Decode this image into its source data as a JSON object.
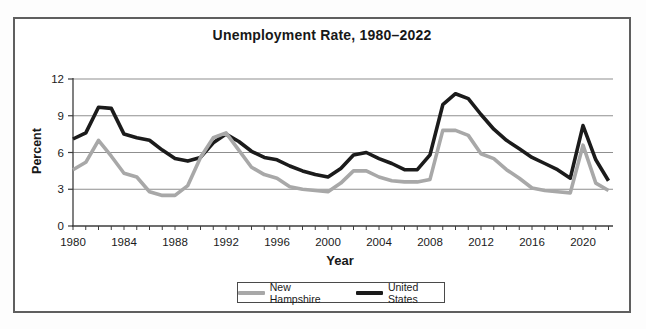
{
  "figure": {
    "title": "Unemployment Rate, 1980–2022",
    "xlabel": "Year",
    "ylabel": "Percent"
  },
  "chart_data": {
    "type": "line",
    "title": "Unemployment Rate, 1980–2022",
    "xlabel": "Year",
    "ylabel": "Percent",
    "x": [
      1980,
      1981,
      1982,
      1983,
      1984,
      1985,
      1986,
      1987,
      1988,
      1989,
      1990,
      1991,
      1992,
      1993,
      1994,
      1995,
      1996,
      1997,
      1998,
      1999,
      2000,
      2001,
      2002,
      2003,
      2004,
      2005,
      2006,
      2007,
      2008,
      2009,
      2010,
      2011,
      2012,
      2013,
      2014,
      2015,
      2016,
      2017,
      2018,
      2019,
      2020,
      2021,
      2022
    ],
    "series": [
      {
        "name": "New Hampshire",
        "color": "#a8a8a8",
        "values": [
          4.6,
          5.2,
          7.0,
          5.7,
          4.3,
          4.0,
          2.8,
          2.5,
          2.5,
          3.3,
          5.6,
          7.2,
          7.6,
          6.2,
          4.8,
          4.2,
          3.9,
          3.2,
          3.0,
          2.9,
          2.8,
          3.5,
          4.5,
          4.5,
          4.0,
          3.7,
          3.6,
          3.6,
          3.8,
          7.8,
          7.8,
          7.4,
          5.9,
          5.5,
          4.6,
          3.9,
          3.1,
          2.9,
          2.8,
          2.7,
          6.6,
          3.5,
          2.9
        ]
      },
      {
        "name": "United States",
        "color": "#1b1b1b",
        "values": [
          7.1,
          7.6,
          9.7,
          9.6,
          7.5,
          7.2,
          7.0,
          6.2,
          5.5,
          5.3,
          5.6,
          6.8,
          7.5,
          6.9,
          6.1,
          5.6,
          5.4,
          4.9,
          4.5,
          4.2,
          4.0,
          4.7,
          5.8,
          6.0,
          5.5,
          5.1,
          4.6,
          4.6,
          5.8,
          9.9,
          10.8,
          10.4,
          9.1,
          7.9,
          7.0,
          6.3,
          5.6,
          5.1,
          4.6,
          3.9,
          8.2,
          5.4,
          3.7
        ]
      }
    ],
    "ylim": [
      0,
      12
    ],
    "y_ticks": [
      0,
      3,
      6,
      9,
      12
    ],
    "x_tick_labels": [
      1980,
      1984,
      1988,
      1992,
      1996,
      2000,
      2004,
      2008,
      2012,
      2016,
      2020
    ],
    "grid": "horizontal",
    "legend_position": "bottom-center",
    "colors": {
      "gridline": "#8f8f8f",
      "axis": "#3c3c3c",
      "tick_text": "#1a1a1a"
    }
  }
}
